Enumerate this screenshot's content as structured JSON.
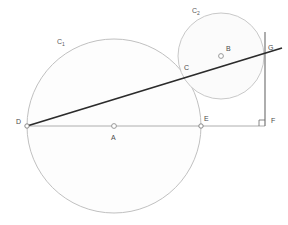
{
  "figure": {
    "background_color": "#ffffff",
    "width": 288,
    "height": 225
  },
  "style": {
    "circle_stroke": "#b9b9b9",
    "circle_fill": "#fdfdfd",
    "thin_line_color": "#9a9a9a",
    "thick_line_color": "#2b2b2b",
    "vertical_line_color": "#6b6b6b",
    "label_color": "#5a5a5a",
    "point_marker_color": "#8f8f8f"
  },
  "circles": [
    {
      "id": "C1",
      "label": "C",
      "label_subscript": "1",
      "label_x": 57,
      "label_y": 44,
      "center_x": 114,
      "center_y": 126,
      "radius": 87
    },
    {
      "id": "C2",
      "label": "C",
      "label_subscript": "2",
      "label_x": 192,
      "label_y": 13,
      "center_x": 221,
      "center_y": 56,
      "radius": 43
    }
  ],
  "points": [
    {
      "id": "A",
      "label": "A",
      "x": 114,
      "y": 126,
      "label_x": 111,
      "label_y": 140,
      "marker": "open-circle"
    },
    {
      "id": "B",
      "label": "B",
      "x": 221,
      "y": 56,
      "label_x": 226,
      "label_y": 51,
      "marker": "open-circle"
    },
    {
      "id": "C",
      "label": "C",
      "x": 188,
      "y": 74,
      "label_x": 184,
      "label_y": 70,
      "marker": "none"
    },
    {
      "id": "D",
      "label": "D",
      "x": 27,
      "y": 126,
      "label_x": 16,
      "label_y": 124,
      "marker": "open-circle"
    },
    {
      "id": "E",
      "label": "E",
      "x": 201,
      "y": 126,
      "label_x": 204,
      "label_y": 121,
      "marker": "open-circle"
    },
    {
      "id": "F",
      "label": "F",
      "x": 265,
      "y": 126,
      "label_x": 271,
      "label_y": 123,
      "marker": "none"
    },
    {
      "id": "G",
      "label": "G",
      "x": 265,
      "y": 52,
      "label_x": 268,
      "label_y": 50,
      "marker": "none"
    }
  ],
  "segments": [
    {
      "id": "DF",
      "name": "horizontal-baseline",
      "x1": 27,
      "y1": 126,
      "x2": 265,
      "y2": 126,
      "weight": "thin"
    },
    {
      "id": "DG",
      "name": "secant-line",
      "x1": 27,
      "y1": 126,
      "x2": 282,
      "y2": 48,
      "weight": "thick"
    },
    {
      "id": "GF",
      "name": "perpendicular-line",
      "x1": 265,
      "y1": 32,
      "x2": 265,
      "y2": 126,
      "weight": "medium"
    }
  ],
  "right_angle": {
    "id": "angle-at-F",
    "vertex_x": 265,
    "vertex_y": 126,
    "size": 6
  }
}
